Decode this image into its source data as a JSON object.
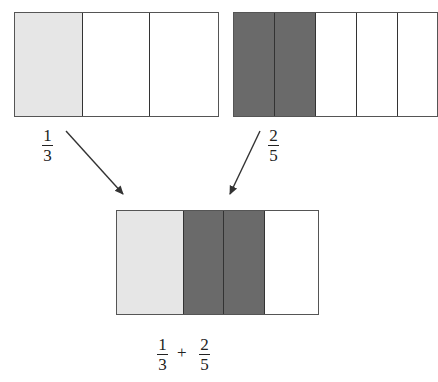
{
  "diagram": {
    "top_left_bar": {
      "label": {
        "numerator": "1",
        "denominator": "3"
      },
      "segments": [
        "light",
        "white",
        "white"
      ]
    },
    "top_right_bar": {
      "label": {
        "numerator": "2",
        "denominator": "5"
      },
      "segments": [
        "dark",
        "dark",
        "white",
        "white",
        "white"
      ]
    },
    "combined_bar": {
      "segments": [
        "light",
        "dark",
        "dark",
        "white"
      ],
      "expression": {
        "left": {
          "numerator": "1",
          "denominator": "3"
        },
        "operator": "+",
        "right": {
          "numerator": "2",
          "denominator": "5"
        }
      }
    },
    "colors": {
      "light": "#e6e6e6",
      "dark": "#6a6a6a",
      "border": "#555555"
    }
  }
}
